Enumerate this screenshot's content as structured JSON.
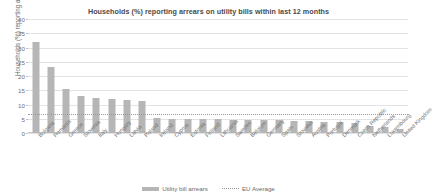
{
  "chart_data": {
    "type": "bar",
    "title": "Households (%) reporting arrears on utility bills within last 12 months",
    "xlabel": "",
    "ylabel": "Households (%) reporting arrears",
    "ylim": [
      0,
      40
    ],
    "yticks": [
      0,
      5,
      10,
      15,
      20,
      25,
      30,
      35,
      40
    ],
    "grid": true,
    "legend_position": "bottom",
    "categories": [
      "Bulgaria",
      "Romania",
      "Greece",
      "Slovenia",
      "Italy",
      "Hungary",
      "Latvia",
      "Poland",
      "Ireland",
      "Cyprus",
      "Estonia",
      "Finland",
      "Lithuania",
      "Sweden",
      "Belgium",
      "Germany",
      "Spain",
      "Slovakia",
      "Austria",
      "Portugal",
      "Denmark",
      "Czech Republic",
      "Netherlands",
      "Luxembourg",
      "United Kingdom"
    ],
    "series": [
      {
        "name": "Utility bill arrears",
        "color": "#b6b6b6",
        "values": [
          32.0,
          23.0,
          15.5,
          13.0,
          12.3,
          11.8,
          11.5,
          11.2,
          5.3,
          5.0,
          5.0,
          4.9,
          4.8,
          4.7,
          4.6,
          4.5,
          4.4,
          4.3,
          4.2,
          4.0,
          3.8,
          3.4,
          2.6,
          2.1,
          1.4
        ]
      }
    ],
    "reference_line": {
      "name": "EU Average",
      "value": 6.7,
      "style": "dotted",
      "color": "#9a9a9a"
    }
  },
  "legend": {
    "items": [
      {
        "label": "Utility bill arrears",
        "type": "bar"
      },
      {
        "label": "EU Average",
        "type": "dotted-line"
      }
    ]
  }
}
